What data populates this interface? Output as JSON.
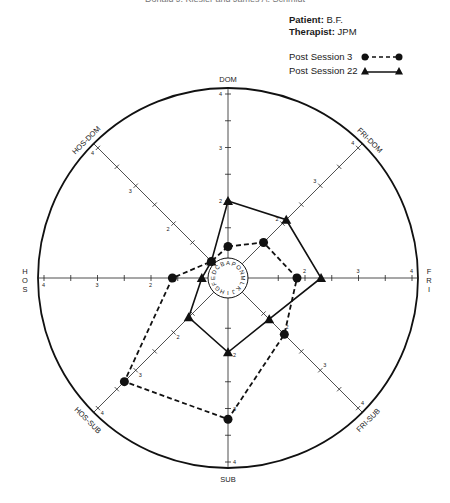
{
  "header": {
    "running_head": "Donald J. Kiesler and James A. Schmidt",
    "patient_label": "Patient:",
    "patient_value": "B.F.",
    "therapist_label": "Therapist:",
    "therapist_value": "JPM"
  },
  "chart_data": {
    "type": "radar",
    "title": "",
    "axes": [
      "DOM",
      "FRI-DOM",
      "FRI",
      "FRI-SUB",
      "SUB",
      "HOS-SUB",
      "HOS",
      "HOS-DOM"
    ],
    "axis_label_display": {
      "DOM": "DOM",
      "FRI-DOM": "FRI-DOM",
      "FRI": "FRI",
      "FRI-SUB": "FRI-SUB",
      "SUB": "SUB",
      "HOS-SUB": "HOS-SUB",
      "HOS": "HOS",
      "HOS-DOM": "HOS-DOM"
    },
    "range": [
      1,
      4
    ],
    "tick_labels": [
      "2",
      "3",
      "4"
    ],
    "tick_values": [
      1.5,
      2,
      2.5,
      3,
      3.5,
      4
    ],
    "inner_ring_letters": [
      "A",
      "B",
      "C",
      "D",
      "E",
      "F",
      "G",
      "H",
      "I",
      "J",
      "K",
      "L",
      "M",
      "N",
      "O",
      "P"
    ],
    "series": [
      {
        "name": "Post Session 3",
        "marker": "circle",
        "line": "dashed",
        "values": [
          1.15,
          1.5,
          1.85,
          2.05,
          3.2,
          3.3,
          1.6,
          1.0
        ]
      },
      {
        "name": "Post Session 22",
        "marker": "triangle",
        "line": "solid",
        "values": [
          2.0,
          2.1,
          2.3,
          1.65,
          1.95,
          1.6,
          1.05,
          1.0
        ]
      }
    ],
    "legend_position": "top-right",
    "grid": false
  }
}
